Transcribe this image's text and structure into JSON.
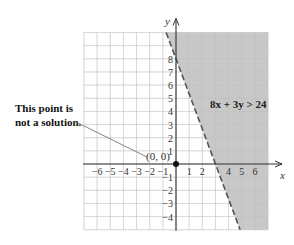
{
  "chart_data": {
    "type": "inequality-graph",
    "title": "",
    "inequality": "8x + 3y > 24",
    "boundary": {
      "equation": "8x + 3y = 24",
      "style": "dashed",
      "x_intercept": 3,
      "y_intercept": 8
    },
    "shaded_side": "right/above boundary (not containing origin)",
    "test_point": {
      "label": "(0, 0)",
      "x": 0,
      "y": 0,
      "is_solution": false
    },
    "callout": [
      "This point is",
      "not a solution."
    ],
    "xlabel": "x",
    "ylabel": "y",
    "xlim": [
      -7,
      7
    ],
    "ylim": [
      -5,
      10
    ],
    "grid": true,
    "x_tick_labels": [
      "−6",
      "−5",
      "−4",
      "−3",
      "−2",
      "−1",
      "1",
      "2",
      "4",
      "5",
      "6"
    ],
    "y_tick_labels": [
      "8",
      "7",
      "6",
      "5",
      "4",
      "3",
      "2",
      "1",
      "−1",
      "−2",
      "−3",
      "−4"
    ]
  },
  "colors": {
    "shade": "#c8c8c8",
    "grid": "#d9d9d9",
    "axis": "#333333",
    "boundary": "#555555"
  }
}
